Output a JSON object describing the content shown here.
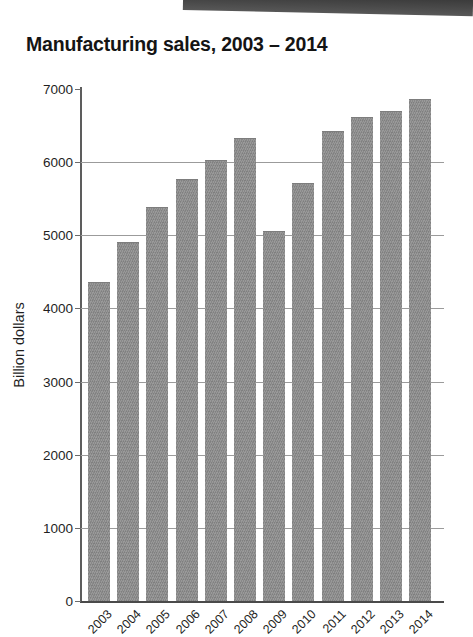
{
  "page": {
    "background_color": "#ffffff",
    "scan_edge_band_color": "#3f3f3f"
  },
  "chart_data": {
    "type": "bar",
    "title": "Manufacturing sales, 2003 – 2014",
    "xlabel": "",
    "ylabel": "Billion dollars",
    "categories": [
      "2003",
      "2004",
      "2005",
      "2006",
      "2007",
      "2008",
      "2009",
      "2010",
      "2011",
      "2012",
      "2013",
      "2014"
    ],
    "values": [
      4350,
      4900,
      5380,
      5750,
      6010,
      6320,
      5050,
      5700,
      6410,
      6600,
      6680,
      6850
    ],
    "ylim": [
      0,
      7000
    ],
    "y_ticks": [
      0,
      1000,
      2000,
      3000,
      4000,
      5000,
      6000,
      7000
    ],
    "y_tick_labels": [
      "0",
      "1000",
      "2000",
      "3000",
      "4000",
      "5000",
      "6000",
      "7000"
    ],
    "grid": "horizontal",
    "gridlines_at": [
      1000,
      2000,
      3000,
      4000,
      5000,
      6000
    ],
    "legend": null,
    "legend_position": "none",
    "bar_color": "#8b8b8b",
    "x_tick_rotation": -45
  }
}
